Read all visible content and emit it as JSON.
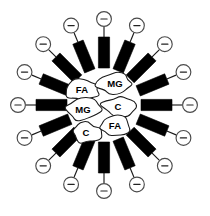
{
  "figure": {
    "type": "micelle-diagram",
    "width": 210,
    "height": 216,
    "background_color": "#ffffff",
    "center": {
      "x": 104,
      "y": 105
    },
    "bar_color": "#000000",
    "outline_color": "#1a1a1a",
    "head_charge_symbol": "−",
    "spoke_count": 16,
    "spokes": [
      {
        "index": 0,
        "angle_deg": -90,
        "charge_label": "−"
      },
      {
        "index": 1,
        "angle_deg": -67.5,
        "charge_label": "−"
      },
      {
        "index": 2,
        "angle_deg": -45,
        "charge_label": "−"
      },
      {
        "index": 3,
        "angle_deg": -22.5,
        "charge_label": "−"
      },
      {
        "index": 4,
        "angle_deg": 0,
        "charge_label": "−"
      },
      {
        "index": 5,
        "angle_deg": 22.5,
        "charge_label": "−"
      },
      {
        "index": 6,
        "angle_deg": 45,
        "charge_label": "−"
      },
      {
        "index": 7,
        "angle_deg": 67.5,
        "charge_label": "−"
      },
      {
        "index": 8,
        "angle_deg": 90,
        "charge_label": "−"
      },
      {
        "index": 9,
        "angle_deg": 112.5,
        "charge_label": "−"
      },
      {
        "index": 10,
        "angle_deg": 135,
        "charge_label": "−"
      },
      {
        "index": 11,
        "angle_deg": 157.5,
        "charge_label": "−"
      },
      {
        "index": 12,
        "angle_deg": 180,
        "charge_label": "−"
      },
      {
        "index": 13,
        "angle_deg": 202.5,
        "charge_label": "−"
      },
      {
        "index": 14,
        "angle_deg": 225,
        "charge_label": "−"
      },
      {
        "index": 15,
        "angle_deg": 247.5,
        "charge_label": "−"
      }
    ],
    "core_blobs": [
      {
        "index": 0,
        "label": "FA",
        "x": 82,
        "y": 90,
        "rx": 17,
        "ry": 10,
        "seed": 3
      },
      {
        "index": 1,
        "label": "MG",
        "x": 115,
        "y": 84,
        "rx": 18,
        "ry": 11,
        "seed": 7
      },
      {
        "index": 2,
        "label": "MG",
        "x": 83,
        "y": 110,
        "rx": 17,
        "ry": 11,
        "seed": 11
      },
      {
        "index": 3,
        "label": "C",
        "x": 118,
        "y": 107,
        "rx": 16,
        "ry": 10,
        "seed": 5
      },
      {
        "index": 4,
        "label": "C",
        "x": 86,
        "y": 133,
        "rx": 15,
        "ry": 10,
        "seed": 13
      },
      {
        "index": 5,
        "label": "FA",
        "x": 115,
        "y": 126,
        "rx": 16,
        "ry": 10,
        "seed": 9
      }
    ]
  }
}
